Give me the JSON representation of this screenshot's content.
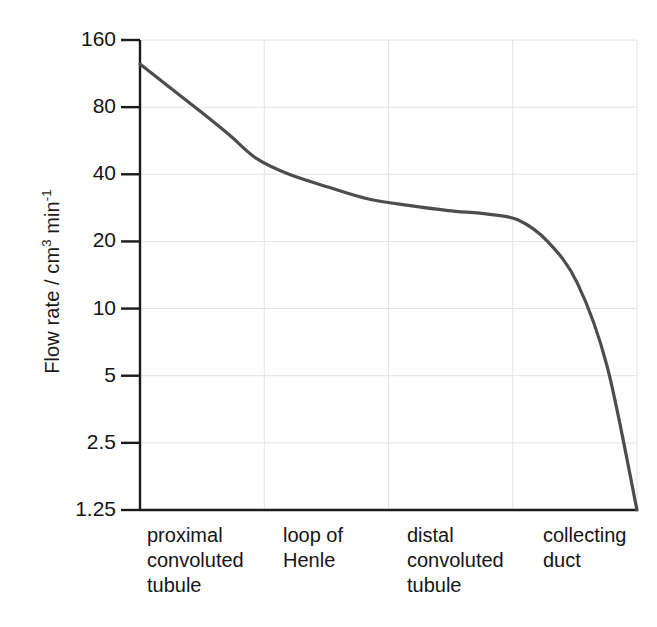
{
  "axes": {
    "y_label_prefix": "Flow rate / cm",
    "y_label_sup1": "3",
    "y_label_mid": " min",
    "y_label_sup2": "-1",
    "y_label_full": "Flow rate / cm3 min-1",
    "x_label": ""
  },
  "chart_data": {
    "type": "line",
    "title": "",
    "xlabel": "",
    "ylabel": "Flow rate / cm3 min-1",
    "yscale": "log",
    "ylim": [
      1.25,
      160
    ],
    "ytick_labels": [
      "160",
      "80",
      "40",
      "20",
      "10",
      "5",
      "2.5",
      "1.25"
    ],
    "ytick_values": [
      160,
      80,
      40,
      20,
      10,
      5,
      2.5,
      1.25
    ],
    "grid": true,
    "grid_axis": "both",
    "legend": "none",
    "categories": [
      "proximal convoluted tubule",
      "loop of Henle",
      "distal convoluted tubule",
      "collecting duct"
    ],
    "category_labels": [
      "proximal\nconvoluted\ntubule",
      "loop of\nHenle",
      "distal\nconvoluted\ntubule",
      "collecting\nduct"
    ],
    "series": [
      {
        "name": "filtrate flow rate",
        "x": [
          0.0,
          0.06,
          0.12,
          0.18,
          0.235,
          0.3,
          0.38,
          0.46,
          0.54,
          0.62,
          0.7,
          0.76,
          0.82,
          0.88,
          0.94,
          1.0
        ],
        "values": [
          125,
          98,
          77,
          60,
          47,
          40,
          35,
          31,
          29,
          27.5,
          26.5,
          25,
          20,
          13,
          5.5,
          1.25
        ]
      }
    ],
    "line_color": "#4d4d4d",
    "grid_color": "#e4e4e4",
    "axis_color": "#1a1a1a"
  }
}
